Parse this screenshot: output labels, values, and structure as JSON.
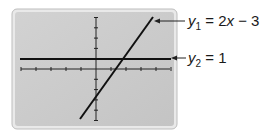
{
  "chart_data": {
    "type": "line",
    "title": "",
    "xlabel": "",
    "ylabel": "",
    "grid": false,
    "xlim": [
      -5,
      5
    ],
    "ylim": [
      -5,
      5
    ],
    "x_tick_step": 1,
    "y_tick_step": 1,
    "series": [
      {
        "name": "y1 = 2x - 3",
        "equation": "y1 = 2x − 3",
        "x": [
          -1.6,
          5.7
        ],
        "y": [
          -6.2,
          5.1
        ]
      },
      {
        "name": "y2 = 1",
        "equation": "y2 = 1",
        "x": [
          -5,
          5
        ],
        "y": [
          1,
          1
        ]
      }
    ],
    "annotations": [
      {
        "text_var": "y",
        "subscript": "1",
        "rest": " = 2",
        "var2": "x",
        "tail": " − 3",
        "points_to": "y1"
      },
      {
        "text_var": "y",
        "subscript": "2",
        "rest": " = 1",
        "points_to": "y2"
      }
    ]
  },
  "labels": {
    "y1": {
      "var": "y",
      "sub": "1",
      "eq": " = 2",
      "xvar": "x",
      "tail": " − 3"
    },
    "y2": {
      "var": "y",
      "sub": "2",
      "eq": " = 1"
    }
  },
  "colors": {
    "screen": "#c9c9c9",
    "frame": "#e6e6e6",
    "line": "#111111"
  }
}
